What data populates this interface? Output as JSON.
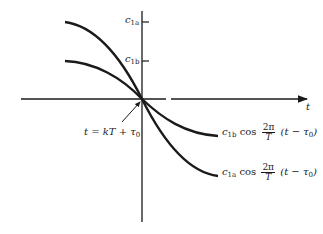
{
  "diagram": {
    "axes": {
      "x_label": "t",
      "y_ticks": [
        {
          "label_main": "c",
          "label_sub": "1a",
          "y": 22
        },
        {
          "label_main": "c",
          "label_sub": "1b",
          "y": 61
        }
      ]
    },
    "annotation": {
      "text": "t = kT + τ",
      "sub": "0"
    },
    "curves": [
      {
        "name": "curve-1b",
        "label": {
          "coef": "c",
          "coef_sub": "1b",
          "fn": "cos",
          "num": "2π",
          "den": "T",
          "arg": "(t − τ",
          "arg_sub": "0",
          "close": ")"
        }
      },
      {
        "name": "curve-1a",
        "label": {
          "coef": "c",
          "coef_sub": "1a",
          "fn": "cos",
          "num": "2π",
          "den": "T",
          "arg": "(t − τ",
          "arg_sub": "0",
          "close": ")"
        }
      }
    ],
    "colors": {
      "ink": "#1a1a1a",
      "background": "#ffffff"
    }
  }
}
